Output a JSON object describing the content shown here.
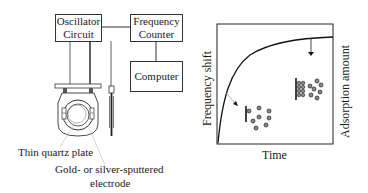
{
  "apparatus": {
    "oscillator_box": {
      "line1": "Oscillator",
      "line2": "Circuit"
    },
    "frequency_counter_box": {
      "line1": "Frequency",
      "line2": "Counter"
    },
    "computer_box": {
      "label": "Computer"
    },
    "labels": {
      "quartz_plate": "Thin quartz plate",
      "electrode_line1": "Gold- or silver-sputtered",
      "electrode_line2": "electrode"
    }
  },
  "graph": {
    "xlabel": "Time",
    "ylabel_left": "Frequency shift",
    "ylabel_right": "Adsorption amount",
    "curve": "saturating rise (adsorption isotherm over time)",
    "insets": [
      {
        "stage": "early",
        "description": "few molecules adsorbed on electrode surface"
      },
      {
        "stage": "late",
        "description": "electrode surface saturated with adsorbed molecules"
      }
    ]
  },
  "colors": {
    "line": "#1a1a1a",
    "molecule_fill": "#8a8a8a",
    "background": "#ffffff"
  }
}
